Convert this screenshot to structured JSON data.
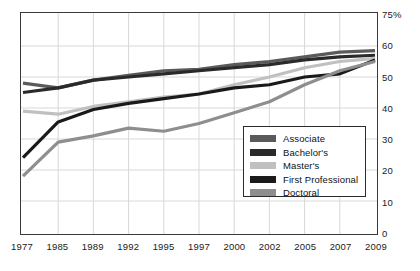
{
  "chart_data": {
    "type": "line",
    "title": "",
    "xlabel": "",
    "ylabel": "",
    "grid": true,
    "legend_position": "inside-lower-right",
    "x": [
      1977,
      1985,
      1989,
      1992,
      1995,
      1997,
      2000,
      2002,
      2005,
      2007,
      2009
    ],
    "xtick_labels": [
      "1977",
      "1985",
      "1989",
      "1992",
      "1995",
      "1997",
      "2000",
      "2002",
      "2005",
      "2007",
      "2009"
    ],
    "ytick_labels": [
      "75%",
      "60",
      "50",
      "40",
      "30",
      "20",
      "10",
      "0"
    ],
    "ytick_values": [
      75,
      60,
      50,
      40,
      30,
      20,
      10,
      0
    ],
    "ylim": [
      0,
      60
    ],
    "axis_note": "top tick labelled 75% is a capped axis label drawn one 10-unit step above 60",
    "series": [
      {
        "name": "Associate",
        "color": "#5a5a5a",
        "values": [
          48.0,
          46.5,
          49.0,
          50.5,
          52.0,
          52.5,
          54.0,
          55.0,
          56.5,
          58.0,
          58.5
        ]
      },
      {
        "name": "Bachelor's",
        "color": "#2a2a2a",
        "values": [
          45.0,
          46.5,
          49.0,
          50.0,
          51.0,
          52.0,
          53.0,
          54.0,
          55.5,
          56.5,
          57.0
        ]
      },
      {
        "name": "Master's",
        "color": "#c0c0c0",
        "values": [
          39.0,
          38.0,
          40.5,
          42.0,
          43.5,
          44.5,
          47.5,
          50.0,
          53.0,
          55.0,
          56.0
        ]
      },
      {
        "name": "First Professional",
        "color": "#1a1a1a",
        "values": [
          24.0,
          35.5,
          39.5,
          41.5,
          43.0,
          44.5,
          46.5,
          47.5,
          50.0,
          51.0,
          55.5
        ]
      },
      {
        "name": "Doctoral",
        "color": "#8e8e8e",
        "values": [
          18.0,
          29.0,
          31.0,
          33.5,
          32.5,
          35.0,
          38.5,
          42.0,
          47.5,
          52.0,
          55.0
        ]
      }
    ]
  },
  "legend": {
    "entries": [
      {
        "label": "Associate"
      },
      {
        "label": "Bachelor's"
      },
      {
        "label": "Master's"
      },
      {
        "label": "First Professional"
      },
      {
        "label": "Doctoral"
      }
    ]
  }
}
